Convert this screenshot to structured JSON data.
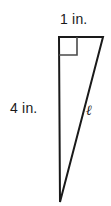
{
  "figure": {
    "type": "right-triangle-diagram",
    "background_color": "#ffffff",
    "stroke_color": "#1a1a1a",
    "labels": {
      "top_leg": "1 in.",
      "left_leg": "4 in.",
      "hypotenuse": "ℓ"
    },
    "markers": {
      "right_angle": "right-angle-square"
    },
    "geometry": {
      "vertices": {
        "top_left": [
          59,
          37
        ],
        "top_right": [
          103,
          37
        ],
        "bottom": [
          60,
          202
        ]
      },
      "right_angle_box_size": 18,
      "stroke_width": 2
    },
    "measurements": {
      "top_leg_value": 1,
      "top_leg_unit": "in.",
      "left_leg_value": 4,
      "left_leg_unit": "in.",
      "hypotenuse_symbol": "ℓ"
    }
  }
}
